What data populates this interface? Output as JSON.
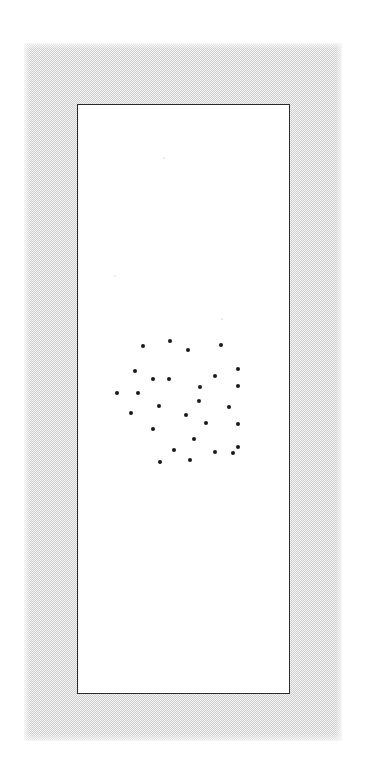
{
  "document": {
    "kind": "scanned-figure",
    "page_background": "#ffffff",
    "mat_color": "#cfcfcf",
    "frame_border_color": "#2b2b2b",
    "point_color": "#1a1a1a",
    "caption": "",
    "title": "",
    "axis_labels_visible": false
  },
  "frame": {
    "left": 77,
    "top": 104,
    "width": 213,
    "height": 590
  },
  "mat": {
    "left": 25,
    "top": 44,
    "width": 316,
    "height": 696
  },
  "chart_data": {
    "type": "scatter",
    "title": "",
    "subtitle": "",
    "xlabel": "",
    "ylabel": "",
    "xlim": [
      0,
      213
    ],
    "ylim": [
      0,
      590
    ],
    "grid": false,
    "legend": null,
    "axis_ticks": false,
    "marker": "filled-circle",
    "marker_size_px": 4,
    "marker_color": "#1a1a1a",
    "n_points": 28,
    "note": "Spatial point pattern; coordinates are pixel offsets inside the framed white plotting page (origin at frame top-left, y increasing downward).",
    "points": [
      {
        "x": 65,
        "y": 241
      },
      {
        "x": 92,
        "y": 236
      },
      {
        "x": 110,
        "y": 245
      },
      {
        "x": 143,
        "y": 240
      },
      {
        "x": 57,
        "y": 266
      },
      {
        "x": 75,
        "y": 274
      },
      {
        "x": 91,
        "y": 274
      },
      {
        "x": 122,
        "y": 282
      },
      {
        "x": 137,
        "y": 271
      },
      {
        "x": 160,
        "y": 264
      },
      {
        "x": 160,
        "y": 281
      },
      {
        "x": 39,
        "y": 288
      },
      {
        "x": 81,
        "y": 301
      },
      {
        "x": 121,
        "y": 296
      },
      {
        "x": 108,
        "y": 310
      },
      {
        "x": 151,
        "y": 302
      },
      {
        "x": 53,
        "y": 308
      },
      {
        "x": 128,
        "y": 318
      },
      {
        "x": 75,
        "y": 324
      },
      {
        "x": 160,
        "y": 319
      },
      {
        "x": 116,
        "y": 334
      },
      {
        "x": 96,
        "y": 345
      },
      {
        "x": 137,
        "y": 347
      },
      {
        "x": 160,
        "y": 342
      },
      {
        "x": 82,
        "y": 357
      },
      {
        "x": 112,
        "y": 355
      },
      {
        "x": 155,
        "y": 348
      },
      {
        "x": 60,
        "y": 288
      }
    ]
  },
  "scan_artifacts": [
    {
      "x": 163,
      "y": 157
    },
    {
      "x": 114,
      "y": 275
    },
    {
      "x": 221,
      "y": 318
    }
  ]
}
